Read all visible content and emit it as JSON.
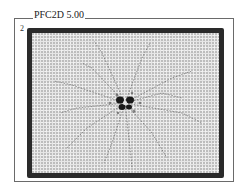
{
  "figure": {
    "title": "PFC2D 5.00",
    "panel_index": "2",
    "colors": {
      "frame": "#6a6a6a",
      "boundary_particles": "#2a2a2a",
      "particles": "#e6e6e6",
      "cracks": "#555555",
      "core": "#1a1a1a"
    }
  }
}
